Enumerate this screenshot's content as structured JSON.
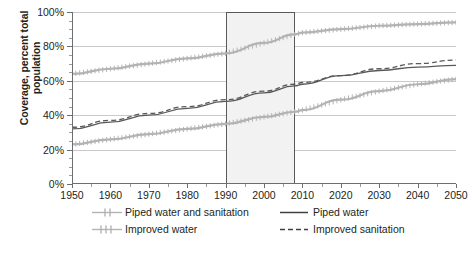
{
  "chart_data": {
    "type": "line",
    "title": "",
    "xlabel": "",
    "ylabel": "Coverage, percent total population",
    "xlim": [
      1950,
      2050
    ],
    "ylim": [
      0,
      100
    ],
    "grid": true,
    "legend_position": "bottom",
    "x_ticks": [
      "1950",
      "1960",
      "1970",
      "1980",
      "1990",
      "2000",
      "2010",
      "2020",
      "2030",
      "2040",
      "2050"
    ],
    "y_ticks": [
      "0%",
      "20%",
      "40%",
      "60%",
      "80%",
      "100%"
    ],
    "x": [
      1950,
      1960,
      1970,
      1980,
      1990,
      2000,
      2008,
      2010,
      2020,
      2030,
      2040,
      2050
    ],
    "annotations": [
      {
        "name": "observed-period-highlight",
        "type": "vertical-band",
        "x_start": 1990,
        "x_end": 2008
      }
    ],
    "series": [
      {
        "name": "Piped water and sanitation",
        "style": "light-gray-tickmarks",
        "color": "#b3b3b3",
        "values": [
          23,
          26,
          29,
          32,
          35,
          39,
          42,
          43,
          49,
          54,
          58,
          61
        ]
      },
      {
        "name": "Improved water",
        "style": "light-gray-tickmarks",
        "color": "#b3b3b3",
        "values": [
          64,
          67,
          70,
          73,
          76,
          82,
          87,
          88,
          90,
          92,
          93,
          94
        ]
      },
      {
        "name": "Piped water",
        "style": "solid-dark",
        "color": "#58595b",
        "values": [
          32,
          36,
          40,
          44,
          48,
          53,
          57,
          58,
          63,
          66,
          68,
          69
        ]
      },
      {
        "name": "Improved sanitation",
        "style": "dashed-dark",
        "color": "#58595b",
        "values": [
          33,
          37,
          41,
          45,
          49,
          54,
          58,
          59,
          63,
          67,
          70,
          72
        ]
      }
    ]
  },
  "legend": {
    "items": [
      {
        "label": "Piped water and sanitation",
        "icon": "line-light-plus-markers"
      },
      {
        "label": "Piped water",
        "icon": "line-solid-dark"
      },
      {
        "label": "Improved water",
        "icon": "line-light-plus-markers"
      },
      {
        "label": "Improved sanitation",
        "icon": "line-dashed-dark"
      }
    ]
  }
}
